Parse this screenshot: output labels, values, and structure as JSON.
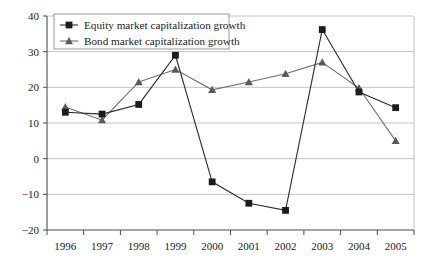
{
  "chart_data": {
    "type": "line",
    "title": "",
    "subtitle": "",
    "xlabel": "",
    "ylabel": "",
    "categories": [
      "1996",
      "1997",
      "1998",
      "1999",
      "2000",
      "2001",
      "2002",
      "2003",
      "2004",
      "2005"
    ],
    "series": [
      {
        "name": "Equity market capitalization growth",
        "marker": "square",
        "color": "#1c1c1c",
        "values": [
          13,
          12.5,
          15.2,
          29,
          -6.5,
          -12.5,
          -14.5,
          36.2,
          18.7,
          14.3
        ]
      },
      {
        "name": "Bond market capitalization growth",
        "marker": "triangle",
        "color": "#5a5a5a",
        "values": [
          14.5,
          10.8,
          21.5,
          25,
          19.3,
          21.5,
          23.8,
          27,
          19.8,
          5
        ]
      }
    ],
    "ylim": [
      -20,
      40
    ],
    "yticks": [
      -20,
      -10,
      0,
      10,
      20,
      30,
      40
    ],
    "ytick_labels": [
      "−20",
      "−10",
      "0",
      "10",
      "20",
      "30",
      "40"
    ],
    "grid": true,
    "legend_position": "top-left",
    "legend": [
      "Equity market capitalization growth",
      "Bond market capitalization growth"
    ]
  }
}
